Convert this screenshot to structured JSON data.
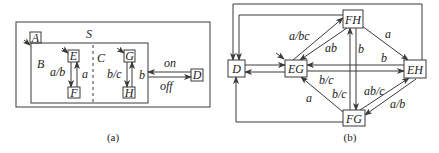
{
  "diagram_a": {
    "caption": "(a)",
    "superstate": "S",
    "initial_state": "A",
    "orthogonal_regions": [
      {
        "name": "B",
        "states": [
          "E",
          "F"
        ],
        "default": "E",
        "transitions": [
          {
            "from": "E",
            "to": "F",
            "label": "a/b"
          },
          {
            "from": "F",
            "to": "E",
            "label": "a"
          }
        ]
      },
      {
        "name": "C",
        "states": [
          "G",
          "H"
        ],
        "default": "G",
        "transitions": [
          {
            "from": "G",
            "to": "H",
            "label": "b/c"
          },
          {
            "from": "H",
            "to": "G",
            "label": "b"
          }
        ]
      }
    ],
    "external_state": "D",
    "external_transitions": [
      {
        "from": "D",
        "to": "A",
        "label": "on"
      },
      {
        "from": "A",
        "to": "D",
        "label": "off"
      }
    ]
  },
  "diagram_b": {
    "caption": "(b)",
    "states": [
      "D",
      "EG",
      "FH",
      "EH",
      "FG"
    ],
    "default": "EG",
    "transitions": [
      {
        "from": "EG",
        "to": "FH",
        "label": "a/bc"
      },
      {
        "from": "FH",
        "to": "EG",
        "label": "ab"
      },
      {
        "from": "FH",
        "to": "FG",
        "label": "b"
      },
      {
        "from": "FG",
        "to": "FH",
        "label": "b/c"
      },
      {
        "from": "FH",
        "to": "EH",
        "label": "a"
      },
      {
        "from": "EH",
        "to": "EG",
        "label": "b"
      },
      {
        "from": "EG",
        "to": "EH",
        "label": "b/c"
      },
      {
        "from": "FG",
        "to": "EG",
        "label": "a"
      },
      {
        "from": "FG",
        "to": "EH",
        "label": "ab/c"
      },
      {
        "from": "EH",
        "to": "FG",
        "label": "a/b"
      },
      {
        "from": "D",
        "to": "EG",
        "label": ""
      },
      {
        "from": "EG",
        "to": "D",
        "label": ""
      },
      {
        "from": "FH",
        "to": "D",
        "label": ""
      },
      {
        "from": "EH",
        "to": "D",
        "label": ""
      },
      {
        "from": "FG",
        "to": "D",
        "label": ""
      }
    ]
  }
}
